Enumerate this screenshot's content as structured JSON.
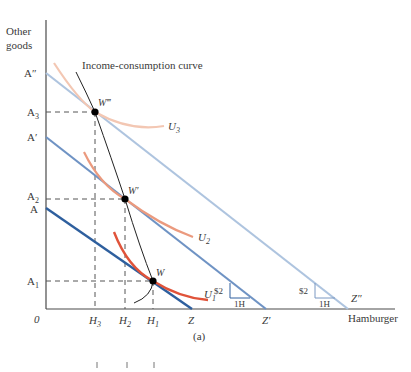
{
  "axes": {
    "y_label_line1": "Other",
    "y_label_line2": "goods",
    "x_label": "Hamburger",
    "origin": "0"
  },
  "y_ticks": [
    {
      "id": "A2prime",
      "label": "A″",
      "y": 73
    },
    {
      "id": "A3",
      "label": "A",
      "sub": "3",
      "y": 112
    },
    {
      "id": "Aprime",
      "label": "A′",
      "y": 137
    },
    {
      "id": "A2",
      "label": "A",
      "sub": "2",
      "y": 199
    },
    {
      "id": "A",
      "label": "A",
      "y": 208
    },
    {
      "id": "A1",
      "label": "A",
      "sub": "1",
      "y": 281
    }
  ],
  "x_ticks": [
    {
      "id": "H3",
      "label": "H",
      "sub": "3",
      "x": 95
    },
    {
      "id": "H2",
      "label": "H",
      "sub": "2",
      "x": 125
    },
    {
      "id": "H1",
      "label": "H",
      "sub": "1",
      "x": 153
    },
    {
      "id": "Z",
      "label": "Z",
      "x": 192
    },
    {
      "id": "Zprime",
      "label": "Z′",
      "x": 266
    },
    {
      "id": "Zdprime",
      "label": "Z″",
      "x": 356
    }
  ],
  "budget_lines": [
    {
      "name": "AZ",
      "from": "A",
      "to": "Z",
      "color": "#2e5f9e"
    },
    {
      "name": "A'Z'",
      "from": "A′",
      "to": "Z′",
      "color": "#6f93c4"
    },
    {
      "name": "A''Z''",
      "from": "A″",
      "to": "Z″",
      "color": "#aec4df"
    }
  ],
  "indifference_curves": [
    {
      "name": "U1",
      "label": "U",
      "sub": "1",
      "color": "#e0533a"
    },
    {
      "name": "U2",
      "label": "U",
      "sub": "2",
      "color": "#eb9a7e"
    },
    {
      "name": "U3",
      "label": "U",
      "sub": "3",
      "color": "#f3c7b3"
    }
  ],
  "points": [
    {
      "name": "W",
      "label": "W"
    },
    {
      "name": "W'",
      "label": "W′"
    },
    {
      "name": "W'''",
      "label": "W‴"
    }
  ],
  "curve_label": "Income-consumption curve",
  "slope_markers": [
    {
      "price": "$2",
      "qty": "1H"
    },
    {
      "price": "$2",
      "qty": "1H"
    }
  ],
  "panel_label": "(a)"
}
